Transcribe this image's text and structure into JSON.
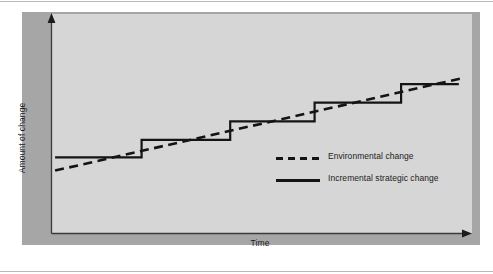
{
  "figure": {
    "background_color": "#ffffff",
    "frame_color": "#a6a6a6",
    "canvas_color": "#d6d6d6",
    "ink_color": "#141414"
  },
  "axes": {
    "y_label": "Amount of change",
    "x_label": "Time",
    "y_axis_name": "vertical-axis-line",
    "x_axis_name": "horizontal-axis-line"
  },
  "legend": {
    "items": [
      {
        "label": "Environmental change",
        "style": "dashed"
      },
      {
        "label": "Incremental strategic change",
        "style": "solid"
      }
    ]
  },
  "chart_data": {
    "type": "line",
    "title": "",
    "xlabel": "Time",
    "ylabel": "Amount of change",
    "xlim": [
      0,
      100
    ],
    "ylim": [
      0,
      100
    ],
    "grid": false,
    "axis_ticks": false,
    "legend_position": "inside-center-right",
    "series": [
      {
        "name": "Environmental change",
        "style": "dashed",
        "color": "#141414",
        "interpolation": "linear",
        "x": [
          0.5,
          100.0
        ],
        "y": [
          28.5,
          71.0
        ],
        "note": "Smooth continuous upward trend line"
      },
      {
        "name": "Incremental strategic change",
        "style": "solid",
        "color": "#141414",
        "interpolation": "step-after",
        "x": [
          0.5,
          21.5,
          21.5,
          43.0,
          43.0,
          63.5,
          63.5,
          84.5,
          84.5,
          98.5
        ],
        "y": [
          34.5,
          34.5,
          42.5,
          42.5,
          51.0,
          51.0,
          59.5,
          59.5,
          68.0,
          68.0
        ],
        "steps": 5,
        "note": "Staircase of discrete strategic shifts tracking the environmental trend"
      }
    ]
  }
}
